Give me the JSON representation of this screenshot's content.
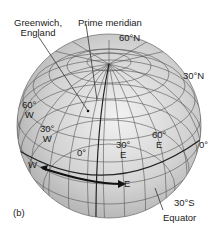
{
  "figure_label": "(b)",
  "callouts": {
    "greenwich": "Greenwich,\nEngland",
    "prime_meridian": "Prime meridian",
    "equator": "Equator"
  },
  "latitude_labels": {
    "lat_60n": "60°N",
    "lat_30n": "30°N",
    "lat_30s": "30°S"
  },
  "longitude_labels": {
    "lon_60w": "60°\nW",
    "lon_30w": "30°\nW",
    "lon_0": "0°",
    "lon_30e": "30°\nE",
    "lon_60e": "60°\nE",
    "lon_0_edge": "0°"
  },
  "direction_arrow": {
    "west": "W",
    "east": "E"
  },
  "colors": {
    "globe_fill": "#c8c8c8",
    "globe_highlight": "#eeeeee",
    "grid_line": "#555555",
    "arrow": "#111111",
    "text": "#222222"
  }
}
